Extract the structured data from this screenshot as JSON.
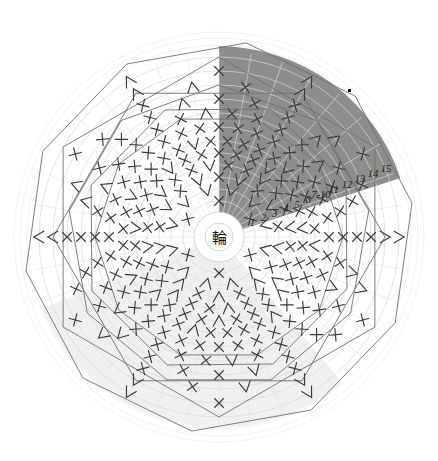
{
  "chart_data": {
    "type": "other",
    "chart_kind": "japanese-crochet-round-diagram",
    "title": "",
    "center_label": "輪",
    "center_label_meaning": "magic-ring",
    "round_labels": [
      "1",
      "2",
      "3",
      "4",
      "5",
      "6",
      "7-10",
      "11",
      "12",
      "13",
      "14",
      "15"
    ],
    "round_count": 15,
    "round_label_positions_deg": 68,
    "rounds": [
      {
        "label": "1",
        "radius": 36,
        "stitch_count": 6,
        "symbols": [
          "X",
          "X",
          "X",
          "X",
          "X",
          "X"
        ]
      },
      {
        "label": "2",
        "radius": 48,
        "stitch_count": 12,
        "symbols": [
          "V",
          "V",
          "V",
          "V",
          "V",
          "V",
          "V",
          "V",
          "V",
          "V",
          "V",
          "V"
        ]
      },
      {
        "label": "3",
        "radius": 60,
        "stitch_count": 18,
        "symbols": [
          "X",
          "V",
          "X",
          "V",
          "X",
          "V",
          "X",
          "V",
          "X",
          "V",
          "X",
          "V",
          "X",
          "V",
          "X",
          "V",
          "X",
          "V"
        ]
      },
      {
        "label": "4",
        "radius": 72,
        "stitch_count": 24,
        "symbols": [
          "X",
          "X",
          "V",
          "X",
          "X",
          "V",
          "X",
          "X",
          "V",
          "X",
          "X",
          "V",
          "X",
          "X",
          "V",
          "X",
          "X",
          "V"
        ]
      },
      {
        "label": "5",
        "radius": 84,
        "stitch_count": 30,
        "symbols": [
          "X",
          "X",
          "X",
          "V",
          "X",
          "X",
          "X",
          "V",
          "X",
          "X",
          "X",
          "V",
          "X",
          "X",
          "X",
          "V"
        ]
      },
      {
        "label": "6",
        "radius": 96,
        "stitch_count": 36,
        "symbols": [
          "X",
          "X",
          "X",
          "X",
          "V",
          "X",
          "X",
          "X",
          "X",
          "V",
          "X",
          "X",
          "X",
          "X",
          "V"
        ]
      },
      {
        "label": "7-10",
        "radius": 110,
        "stitch_count": 36,
        "symbols": [
          "X",
          "X",
          "X",
          "X",
          "X",
          "X",
          "X",
          "X",
          "X",
          "X",
          "X",
          "X"
        ]
      },
      {
        "label": "11",
        "radius": 124,
        "stitch_count": 30,
        "symbols": [
          "X",
          "X",
          "X",
          "X",
          "A",
          "X",
          "X",
          "X",
          "X",
          "A",
          "X",
          "X",
          "X",
          "X",
          "A"
        ]
      },
      {
        "label": "12",
        "radius": 138,
        "stitch_count": 24,
        "symbols": [
          "X",
          "X",
          "X",
          "A",
          "X",
          "X",
          "X",
          "A",
          "X",
          "X",
          "X",
          "A"
        ]
      },
      {
        "label": "13",
        "radius": 152,
        "stitch_count": 18,
        "symbols": [
          "X",
          "X",
          "A",
          "X",
          "X",
          "A",
          "X",
          "X",
          "A"
        ]
      },
      {
        "label": "14",
        "radius": 166,
        "stitch_count": 12,
        "symbols": [
          "X",
          "A",
          "X",
          "A",
          "X",
          "A"
        ]
      },
      {
        "label": "15",
        "radius": 180,
        "stitch_count": 6,
        "symbols": [
          "A",
          "A",
          "A",
          "A",
          "A",
          "A"
        ]
      }
    ],
    "symbol_legend": [
      {
        "symbol": "X",
        "name": "single-crochet",
        "glyph": "×"
      },
      {
        "symbol": "V",
        "name": "increase",
        "glyph": "V"
      },
      {
        "symbol": "A",
        "name": "decrease",
        "glyph": "∧"
      }
    ],
    "color_sectors": [
      {
        "name": "dark-sector",
        "color": "#8d8d8d",
        "start_angle_deg": 0,
        "end_angle_deg": 72,
        "note": "lower right wedge"
      },
      {
        "name": "light-sector",
        "color": "#f0f0f0",
        "start_angle_deg": 140,
        "end_angle_deg": 248,
        "note": "left wedge"
      }
    ],
    "markers": [
      {
        "name": "start-marker-dot",
        "color": "#111111",
        "x": 348,
        "y": 89
      }
    ],
    "axis_grid": {
      "rings": true,
      "spokes": true,
      "ring_color": "#d8d8d8"
    },
    "geometry": {
      "center_x": 219,
      "center_y": 237,
      "outer_radius": 205,
      "center_circle_radius": 25
    }
  },
  "canvas": {
    "width": 438,
    "height": 461,
    "background": "#ffffff"
  }
}
